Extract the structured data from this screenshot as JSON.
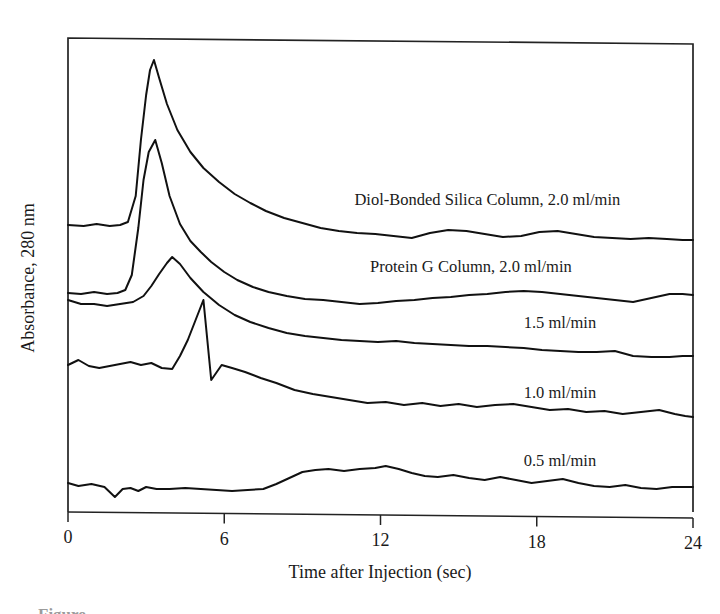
{
  "figure": {
    "background_color": "#ffffff",
    "line_color": "#111111",
    "axis_color": "#232323",
    "caption_fragment": "Figure"
  },
  "chart_data": {
    "type": "line",
    "title": "",
    "xlabel": "Time after Injection (sec)",
    "ylabel": "Absorbance, 280 nm",
    "xlim": [
      0,
      24
    ],
    "ylim": [
      0,
      1
    ],
    "grid": false,
    "legend_position": "inline-right",
    "xticks": [
      0,
      6,
      12,
      18,
      24
    ],
    "xticklabels": [
      "0",
      "6",
      "12",
      "18",
      "24"
    ],
    "yticks": [],
    "yticklabels": [],
    "note": "Stacked/offset chromatogram traces; y axis is arbitrary absorbance units with no tick labels.",
    "series": [
      {
        "name": "Diol-Bonded Silica Column, 2.0 ml/min",
        "label": "Diol-Bonded Silica Column, 2.0 ml/min",
        "label_x": 11.0,
        "label_y_px": 205,
        "baseline_px": 225,
        "peak_time": 3.3,
        "peak_px": 60,
        "x": [
          0.0,
          0.6,
          1.1,
          1.6,
          2.0,
          2.3,
          2.6,
          2.8,
          3.0,
          3.15,
          3.3,
          3.5,
          3.8,
          4.2,
          4.7,
          5.2,
          5.8,
          6.4,
          7.0,
          7.6,
          8.3,
          9.0,
          9.7,
          10.4,
          11.1,
          11.8,
          12.5,
          13.2,
          13.9,
          14.6,
          15.3,
          16.0,
          16.7,
          17.4,
          18.1,
          18.8,
          19.5,
          20.2,
          20.9,
          21.6,
          22.3,
          23.0,
          23.6,
          24.0
        ],
        "y_px": [
          225,
          226,
          224,
          226,
          225,
          222,
          196,
          140,
          95,
          70,
          60,
          78,
          104,
          130,
          152,
          168,
          182,
          194,
          203,
          211,
          218,
          223,
          228,
          231,
          233,
          234,
          236,
          238,
          233,
          230,
          231,
          234,
          237,
          236,
          232,
          231,
          234,
          237,
          238,
          239,
          238,
          239,
          240,
          240
        ]
      },
      {
        "name": "Protein G Column, 2.0 ml/min",
        "label": "Protein G Column, 2.0 ml/min",
        "label_x": 11.6,
        "label_y_px": 272,
        "baseline_px": 293,
        "peak_time": 3.35,
        "peak_px": 140,
        "x": [
          0.0,
          0.5,
          1.0,
          1.5,
          1.9,
          2.2,
          2.45,
          2.7,
          2.9,
          3.1,
          3.35,
          3.6,
          3.9,
          4.3,
          4.7,
          5.1,
          5.5,
          6.0,
          6.5,
          7.1,
          7.7,
          8.4,
          9.1,
          9.8,
          10.5,
          11.2,
          11.9,
          12.6,
          13.3,
          14.0,
          14.7,
          15.4,
          16.1,
          16.8,
          17.5,
          18.2,
          18.9,
          19.6,
          20.3,
          21.0,
          21.7,
          22.4,
          23.1,
          23.6,
          24.0
        ],
        "y_px": [
          293,
          294,
          292,
          294,
          293,
          290,
          275,
          228,
          180,
          152,
          140,
          163,
          196,
          224,
          241,
          252,
          262,
          272,
          280,
          287,
          292,
          296,
          299,
          300,
          302,
          304,
          303,
          301,
          300,
          298,
          297,
          295,
          294,
          292,
          291,
          292,
          294,
          296,
          298,
          300,
          302,
          298,
          294,
          294,
          295
        ]
      },
      {
        "name": "1.5 ml/min",
        "label": "1.5 ml/min",
        "label_x": 17.5,
        "label_y_px": 328,
        "baseline_px": 300,
        "peak_time": 4.0,
        "peak_px": 257,
        "x": [
          0.0,
          0.5,
          1.0,
          1.5,
          2.0,
          2.5,
          2.9,
          3.2,
          3.5,
          3.8,
          4.0,
          4.3,
          4.7,
          5.2,
          5.8,
          6.4,
          7.0,
          7.7,
          8.4,
          9.1,
          9.8,
          10.5,
          11.2,
          11.9,
          12.6,
          13.3,
          14.0,
          14.7,
          15.4,
          16.1,
          16.8,
          17.5,
          18.2,
          18.9,
          19.6,
          20.3,
          21.0,
          21.7,
          22.4,
          23.1,
          23.6,
          24.0
        ],
        "y_px": [
          300,
          304,
          304,
          306,
          304,
          302,
          296,
          286,
          274,
          263,
          257,
          264,
          278,
          292,
          305,
          315,
          322,
          328,
          333,
          336,
          338,
          340,
          341,
          342,
          341,
          343,
          344,
          345,
          346,
          346,
          347,
          348,
          350,
          351,
          352,
          352,
          351,
          356,
          357,
          357,
          356,
          356
        ]
      },
      {
        "name": "1.0 ml/min",
        "label": "1.0 ml/min",
        "label_x": 17.5,
        "label_y_px": 398,
        "baseline_px": 365,
        "peak_time": 5.9,
        "peak_px": 365,
        "x": [
          0.0,
          0.4,
          0.8,
          1.2,
          1.6,
          2.0,
          2.4,
          2.8,
          3.2,
          3.6,
          4.0,
          4.3,
          4.6,
          4.9,
          5.2,
          5.5,
          5.9,
          6.3,
          6.8,
          7.4,
          8.0,
          8.7,
          9.4,
          10.1,
          10.8,
          11.5,
          12.2,
          12.9,
          13.6,
          14.3,
          15.0,
          15.7,
          16.4,
          17.1,
          17.8,
          18.5,
          19.2,
          19.9,
          20.6,
          21.3,
          22.0,
          22.7,
          23.3,
          23.7,
          24.0
        ],
        "y_px": [
          365,
          360,
          366,
          368,
          366,
          364,
          362,
          365,
          363,
          368,
          369,
          356,
          340,
          320,
          300,
          380,
          365,
          368,
          372,
          378,
          383,
          390,
          394,
          397,
          400,
          403,
          402,
          405,
          403,
          406,
          404,
          407,
          405,
          404,
          407,
          410,
          409,
          412,
          411,
          414,
          412,
          410,
          414,
          416,
          417
        ]
      },
      {
        "name": "0.5 ml/min",
        "label": "0.5 ml/min",
        "label_x": 17.5,
        "label_y_px": 466,
        "baseline_px": 483,
        "peak_time": 12.2,
        "peak_px": 466,
        "x": [
          0.0,
          0.4,
          0.9,
          1.4,
          1.8,
          2.1,
          2.4,
          2.7,
          3.0,
          3.4,
          3.9,
          4.5,
          5.1,
          5.7,
          6.3,
          6.9,
          7.5,
          8.0,
          8.5,
          9.0,
          9.5,
          10.0,
          10.6,
          11.2,
          11.8,
          12.2,
          12.7,
          13.2,
          13.7,
          14.2,
          14.8,
          15.4,
          16.0,
          16.6,
          17.2,
          17.8,
          18.4,
          19.0,
          19.6,
          20.2,
          20.8,
          21.4,
          22.0,
          22.6,
          23.2,
          23.7,
          24.0
        ],
        "y_px": [
          483,
          486,
          484,
          487,
          497,
          489,
          488,
          491,
          487,
          489,
          489,
          488,
          489,
          490,
          491,
          490,
          489,
          484,
          478,
          472,
          470,
          469,
          471,
          469,
          468,
          466,
          469,
          473,
          476,
          477,
          475,
          478,
          480,
          477,
          480,
          483,
          481,
          479,
          483,
          486,
          487,
          485,
          488,
          489,
          487,
          487,
          487
        ]
      }
    ]
  },
  "axes": {
    "x_axis_label": "Time after Injection (sec)",
    "y_axis_label": "Absorbance, 280 nm",
    "x_tick_labels": [
      "0",
      "6",
      "12",
      "18",
      "24"
    ]
  }
}
